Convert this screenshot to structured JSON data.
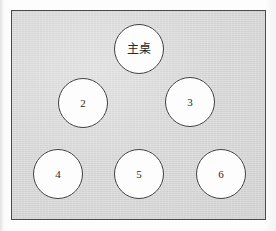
{
  "figure": {
    "kind": "seating-layout-diagram",
    "frame": {
      "x": 11,
      "y": 10,
      "width": 255,
      "height": 210,
      "fill_color": "#d7d7d7",
      "border_color": "#4a4a4a"
    },
    "node_style": {
      "fill_color": "#fdfdfd",
      "border_color": "#3d3d3d",
      "diameter": 50
    },
    "nodes": [
      {
        "id": "head-table",
        "label": "主桌",
        "script": "cjk",
        "cx": 139,
        "cy": 49,
        "d": 50
      },
      {
        "id": "table-2",
        "label": "2",
        "script": "numeric",
        "cx": 83,
        "cy": 103,
        "d": 50
      },
      {
        "id": "table-3",
        "label": "3",
        "script": "numeric",
        "cx": 190,
        "cy": 102,
        "d": 50
      },
      {
        "id": "table-4",
        "label": "4",
        "script": "numeric",
        "cx": 58,
        "cy": 174,
        "d": 50
      },
      {
        "id": "table-5",
        "label": "5",
        "script": "numeric",
        "cx": 139,
        "cy": 174,
        "d": 50
      },
      {
        "id": "table-6",
        "label": "6",
        "script": "numeric",
        "cx": 221,
        "cy": 174,
        "d": 50
      }
    ]
  }
}
